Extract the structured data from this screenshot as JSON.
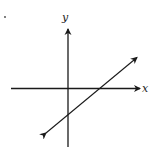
{
  "diagram": {
    "type": "coordinate-plane-line",
    "axes": {
      "x_label": "x",
      "y_label": "y"
    },
    "line": {
      "description": "Line with positive slope, negative y-intercept, positive x-intercept, arrows at both ends"
    },
    "colors": {
      "ink": "#1a1a1a",
      "background": "#ffffff"
    }
  }
}
